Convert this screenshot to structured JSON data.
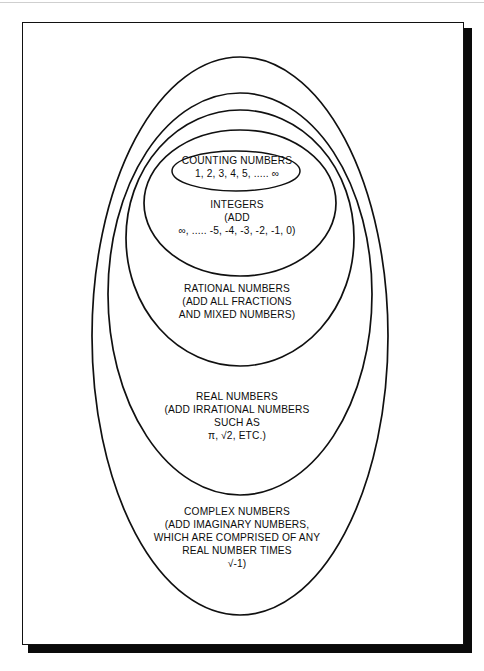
{
  "figure": {
    "kind": "nested-set-venn-diagram",
    "background_color": "#ffffff",
    "line_color": "#101010",
    "frame": {
      "border_color": "#111111",
      "shadow_color": "#0a0a0a"
    }
  },
  "sets": [
    {
      "id": "counting",
      "name": "counting-numbers",
      "level": 1,
      "lines": [
        "COUNTING NUMBERS",
        "1, 2, 3, 4, 5, ..... ∞"
      ]
    },
    {
      "id": "integers",
      "name": "integers",
      "level": 2,
      "lines": [
        "INTEGERS",
        "(ADD",
        "∞, ..... -5, -4, -3, -2, -1, 0)"
      ]
    },
    {
      "id": "rational",
      "name": "rational-numbers",
      "level": 3,
      "lines": [
        "RATIONAL NUMBERS",
        "(ADD ALL FRACTIONS",
        "AND MIXED NUMBERS)"
      ]
    },
    {
      "id": "real",
      "name": "real-numbers",
      "level": 4,
      "lines": [
        "REAL NUMBERS",
        "(ADD IRRATIONAL NUMBERS",
        "SUCH AS",
        "π, √2, ETC.)"
      ]
    },
    {
      "id": "complex",
      "name": "complex-numbers",
      "level": 5,
      "lines": [
        "COMPLEX NUMBERS",
        "(ADD IMAGINARY NUMBERS,",
        "WHICH ARE COMPRISED OF ANY",
        "REAL NUMBER TIMES",
        "√-1)"
      ]
    }
  ]
}
